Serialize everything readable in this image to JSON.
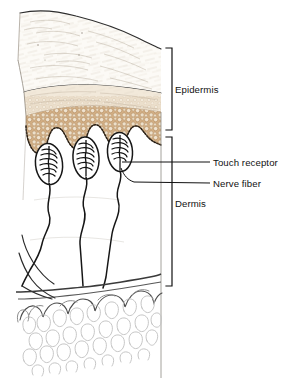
{
  "figure": {
    "background_color": "#ffffff",
    "width": 307,
    "height": 383
  },
  "labels": {
    "epidermis": "Epidermis",
    "dermis": "Dermis",
    "touch_receptor": "Touch receptor",
    "nerve_fiber": "Nerve fiber"
  },
  "brackets": [
    {
      "name": "epidermis-bracket",
      "label": "Epidermis",
      "top": 48,
      "bottom": 130,
      "x": 172
    },
    {
      "name": "dermis-bracket",
      "label": "Dermis",
      "top": 137,
      "bottom": 286,
      "x": 172
    }
  ],
  "leader_lines": [
    {
      "name": "touch-receptor-leader",
      "label": "Touch receptor",
      "from_x": 120,
      "to_x": 210,
      "y": 162
    },
    {
      "name": "nerve-fiber-leader",
      "label": "Nerve fiber",
      "from_x": 122,
      "to_x": 210,
      "y": 183
    }
  ],
  "structures": [
    {
      "name": "stratum-corneum",
      "label": "Stratum corneum",
      "color": "#fbf8f2"
    },
    {
      "name": "granular-layer",
      "label": "Granular layer",
      "color": "#f4ece0"
    },
    {
      "name": "stratum-spinosum",
      "label": "Cellular layer",
      "color": "#d6b78f"
    },
    {
      "name": "basal-layer",
      "label": "Basal layer",
      "color": "#2b2118"
    },
    {
      "name": "dermis-layer",
      "label": "Dermis",
      "color": "#ffffff"
    },
    {
      "name": "subcutaneous-fat",
      "label": "Subcutaneous fat",
      "color": "#d8d8d8"
    }
  ],
  "touch_receptors": [
    {
      "name": "touch-receptor-1",
      "cx": 49,
      "cy": 163,
      "rx": 13,
      "ry": 20
    },
    {
      "name": "touch-receptor-2",
      "cx": 85,
      "cy": 158,
      "rx": 13,
      "ry": 21
    },
    {
      "name": "touch-receptor-3",
      "cx": 120,
      "cy": 152,
      "rx": 12,
      "ry": 19
    }
  ],
  "colors": {
    "ink": "#1a1a1a",
    "line": "#3a3a3a",
    "fat_outline": "#b9b9b9",
    "epidermis_top": "#fcfaf6",
    "epidermis_mid": "#f2e9da",
    "epidermis_cells": "#d2ae84",
    "cell_ring": "#b08a5e",
    "text": "#111111"
  }
}
